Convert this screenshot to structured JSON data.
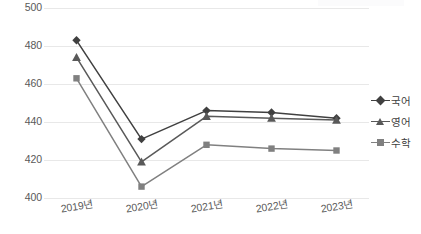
{
  "chart_data": {
    "type": "line",
    "title": "",
    "subtitle": "",
    "xlabel": "",
    "ylabel": "",
    "categories": [
      "2019년",
      "2020년",
      "2021년",
      "2022년",
      "2023년"
    ],
    "ylim": [
      400,
      500
    ],
    "y_ticks": [
      500,
      480,
      460,
      440,
      420,
      400
    ],
    "y_tick_labels": [
      "500",
      "480",
      "460",
      "440",
      "420",
      "400"
    ],
    "grid": true,
    "legend_position": "right",
    "series": [
      {
        "name": "국어",
        "marker": "diamond",
        "color": "#404040",
        "values": [
          483,
          431,
          446,
          445,
          442
        ]
      },
      {
        "name": "영어",
        "marker": "triangle",
        "color": "#595959",
        "values": [
          474,
          419,
          443,
          442,
          441
        ]
      },
      {
        "name": "수학",
        "marker": "square",
        "color": "#808080",
        "values": [
          463,
          406,
          428,
          426,
          425
        ]
      }
    ]
  },
  "axis": {
    "y_labels": [
      "500",
      "480",
      "460",
      "440",
      "420",
      "400"
    ],
    "x_labels": [
      "2019년",
      "2020년",
      "2021년",
      "2022년",
      "2023년"
    ]
  },
  "legend": {
    "items": [
      {
        "label": "국어",
        "color": "#404040",
        "marker": "diamond"
      },
      {
        "label": "영어",
        "color": "#595959",
        "marker": "triangle"
      },
      {
        "label": "수학",
        "color": "#808080",
        "marker": "square"
      }
    ]
  },
  "colors": {
    "gridline": "#e8e8e8",
    "tick_text": "#595959",
    "legend_text": "#404040",
    "background": "#ffffff"
  }
}
